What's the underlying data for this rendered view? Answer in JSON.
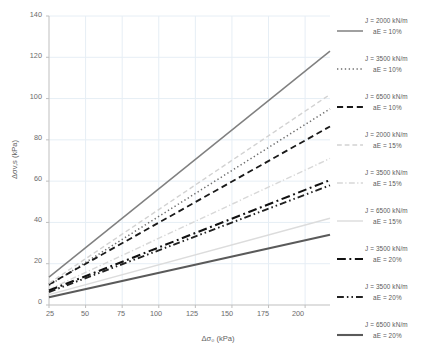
{
  "chart_data": {
    "type": "line",
    "title": "",
    "xlabel": "Δσ₀ (kPa)",
    "ylabel": "Δσv,s (kPa)",
    "xlim": [
      25,
      217
    ],
    "ylim": [
      0,
      140
    ],
    "xticks": [
      25,
      50,
      75,
      100,
      125,
      150,
      175,
      200
    ],
    "yticks": [
      0,
      20,
      40,
      60,
      80,
      100,
      120,
      140
    ],
    "grid": true,
    "legend_position": "right",
    "series": [
      {
        "name": "J = 2000 kN/m aE = 10%",
        "label_line1": "J  =  2000 kN/m",
        "label_line2": "aE  =  10%",
        "style": "solid",
        "color": "#808080",
        "width": 1.5,
        "x": [
          25,
          217
        ],
        "y": [
          13.5,
          123.0
        ]
      },
      {
        "name": "J = 3500 kN/m aE = 10%",
        "label_line1": "J  =  3500 kN/m",
        "label_line2": "aE  =  10%",
        "style": "dotted",
        "color": "#6e6e6e",
        "width": 1.5,
        "x": [
          25,
          217
        ],
        "y": [
          9.5,
          95.0
        ]
      },
      {
        "name": "J = 6500 kN/m aE = 10%",
        "label_line1": "J  =  6500 kN/m",
        "label_line2": "aE  =  10%",
        "style": "dashed",
        "color": "#1a1a1a",
        "width": 1.8,
        "x": [
          25,
          217
        ],
        "y": [
          10.0,
          86.5
        ]
      },
      {
        "name": "J = 2000 kN/m aE = 15%",
        "label_line1": "J  =  2000 kN/m",
        "label_line2": "aE  =  15%",
        "style": "dashed",
        "color": "#d2d2d2",
        "width": 1.4,
        "x": [
          25,
          217
        ],
        "y": [
          10.5,
          102.0
        ]
      },
      {
        "name": "J = 3500 kN/m aE = 15%",
        "label_line1": "J  =  3500 kN/m",
        "label_line2": "aE  =  15%",
        "style": "dashdot",
        "color": "#d8d8d8",
        "width": 1.4,
        "x": [
          25,
          217
        ],
        "y": [
          7.5,
          71.0
        ]
      },
      {
        "name": "J = 6500 kN/m aE = 15%",
        "label_line1": "J  =  6500 kN/m",
        "label_line2": "aE  =  15%",
        "style": "solid",
        "color": "#dcdcdc",
        "width": 1.4,
        "x": [
          25,
          217
        ],
        "y": [
          5.0,
          42.0
        ]
      },
      {
        "name": "J = 3500 kN/m aE = 20% (a)",
        "label_line1": "J  =  3500 kN/m",
        "label_line2": "aE  =  20%",
        "style": "dashdot",
        "color": "#111111",
        "width": 2.1,
        "x": [
          25,
          217
        ],
        "y": [
          7.0,
          60.5
        ]
      },
      {
        "name": "J = 3500 kN/m aE = 20% (b)",
        "label_line1": "J  =  3500 kN/m",
        "label_line2": "aE  =  20%",
        "style": "dashdotdot",
        "color": "#222222",
        "width": 1.9,
        "x": [
          25,
          217
        ],
        "y": [
          6.3,
          58.0
        ]
      },
      {
        "name": "J = 6500 kN/m aE = 20%",
        "label_line1": "J  =  6500 kN/m",
        "label_line2": "aE  =  20%",
        "style": "solid",
        "color": "#5a5a5a",
        "width": 2.1,
        "x": [
          25,
          217
        ],
        "y": [
          3.8,
          34.0
        ]
      }
    ]
  },
  "axes": {
    "x_title": "Δσ₀ (kPa)",
    "y_title": "Δσv,s (kPa)",
    "x_tick_labels": [
      "25",
      "50",
      "75",
      "100",
      "125",
      "150",
      "175",
      "200"
    ],
    "y_tick_labels": [
      "0",
      "20",
      "40",
      "60",
      "80",
      "100",
      "120",
      "140"
    ]
  },
  "colors": {
    "grid": "#e6eef5",
    "axis": "#bfbfbf",
    "text": "#5f5f5f"
  }
}
